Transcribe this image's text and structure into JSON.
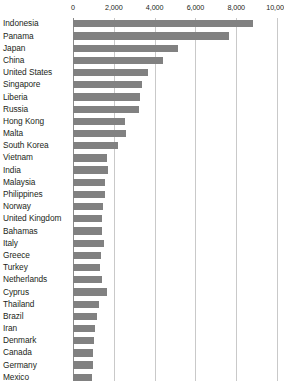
{
  "chart_data": {
    "type": "bar",
    "orientation": "horizontal",
    "title": "",
    "subtitle": "",
    "xlabel": "",
    "ylabel": "",
    "xlim": [
      0,
      10000
    ],
    "ylim": null,
    "grid": true,
    "legend": null,
    "legend_position": "none",
    "bar_color": "#818181",
    "gridline_color": "#c9c9c9",
    "axis_color": "#8a8a8a",
    "text_color": "#231f20",
    "xticks": [
      0,
      2000,
      4000,
      6000,
      8000,
      10000
    ],
    "xtick_labels": [
      "0",
      "2,000",
      "4,000",
      "6,000",
      "8,000",
      "10,000"
    ],
    "categories": [
      "Indonesia",
      "Panama",
      "Japan",
      "China",
      "United States",
      "Singapore",
      "Liberia",
      "Russia",
      "Hong Kong",
      "Malta",
      "South Korea",
      "Vietnam",
      "India",
      "Malaysia",
      "Philippines",
      "Norway",
      "United Kingdom",
      "Bahamas",
      "Italy",
      "Greece",
      "Turkey",
      "Netherlands",
      "Cyprus",
      "Thailand",
      "Brazil",
      "Iran",
      "Denmark",
      "Canada",
      "Germany",
      "Mexico"
    ],
    "values": [
      8830,
      7650,
      5150,
      4410,
      3680,
      3380,
      3280,
      3230,
      2550,
      2600,
      2200,
      1670,
      1720,
      1570,
      1570,
      1470,
      1420,
      1420,
      1520,
      1370,
      1320,
      1420,
      1670,
      1270,
      1180,
      1080,
      1030,
      980,
      980,
      930
    ],
    "note": "Horizontal bar chart, rows sorted descending; bottom row (Mexico) is clipped by the screenshot edge."
  }
}
